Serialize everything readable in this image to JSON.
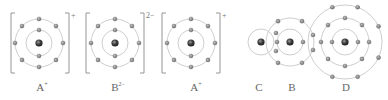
{
  "ions": [
    {
      "id": "ion-A-1",
      "symbol": "A",
      "charge": "+",
      "cx": 39,
      "cy": 43,
      "bracket_left": 11,
      "bracket_right": 69,
      "label_x": 42
    },
    {
      "id": "ion-B",
      "symbol": "B",
      "charge": "2−",
      "cx": 115,
      "cy": 43,
      "bracket_left": 86,
      "bracket_right": 144,
      "label_x": 118
    },
    {
      "id": "ion-A-2",
      "symbol": "A",
      "charge": "+",
      "cx": 191,
      "cy": 43,
      "bracket_left": 162,
      "bracket_right": 220,
      "label_x": 196
    }
  ],
  "ion_shells": {
    "inner_r": 13,
    "outer_r": 24,
    "inner_electrons": 2,
    "outer_electrons": 8
  },
  "molecule": {
    "atoms": [
      {
        "symbol": "C",
        "cx": 261,
        "cy": 42,
        "label_x": 259
      },
      {
        "symbol": "B",
        "cx": 290,
        "cy": 42,
        "label_x": 292
      },
      {
        "symbol": "D",
        "cx": 345,
        "cy": 42,
        "label_x": 346
      }
    ]
  },
  "labels": [
    {
      "text": "A",
      "sup": "+",
      "x": 42
    },
    {
      "text": "B",
      "sup": "2−",
      "x": 118
    },
    {
      "text": "A",
      "sup": "+",
      "x": 196
    },
    {
      "text": "C",
      "sup": "",
      "x": 259
    },
    {
      "text": "B",
      "sup": "",
      "x": 292
    },
    {
      "text": "D",
      "sup": "",
      "x": 346
    }
  ],
  "colors": {
    "orbit": "#c8c8c8",
    "electron": "#8a8a8a",
    "nucleus": "#444444",
    "text": "#666666"
  }
}
